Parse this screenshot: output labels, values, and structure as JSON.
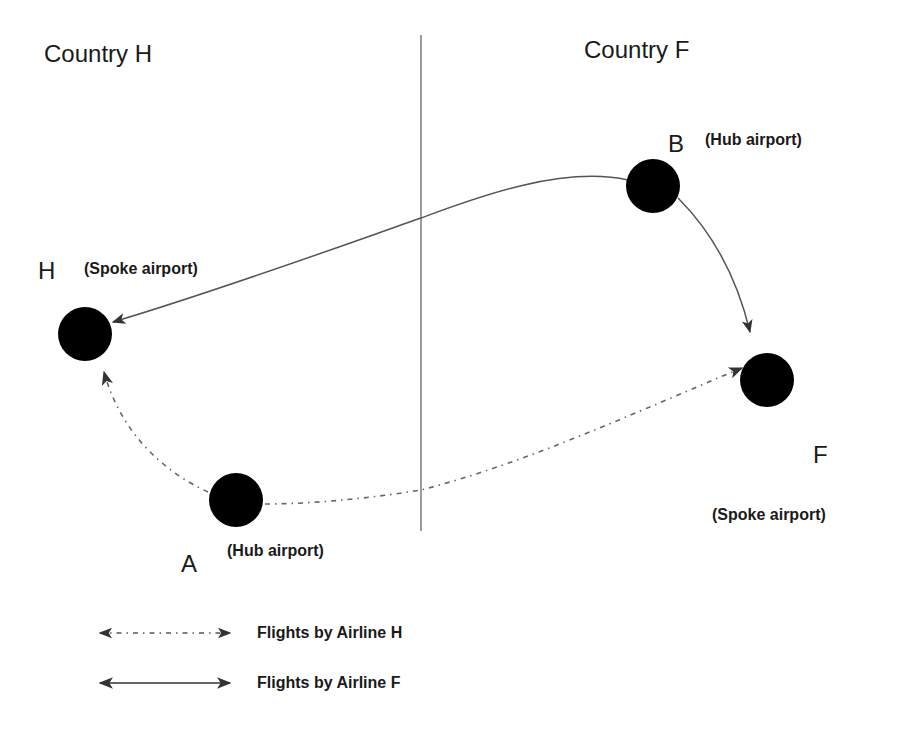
{
  "regions": {
    "left": {
      "label": "Country H"
    },
    "right": {
      "label": "Country F"
    }
  },
  "nodes": {
    "B": {
      "letter": "B",
      "role": "(Hub airport)",
      "country": "F"
    },
    "H": {
      "letter": "H",
      "role": "(Spoke airport)",
      "country": "H"
    },
    "A": {
      "letter": "A",
      "role": "(Hub airport)",
      "country": "H"
    },
    "F": {
      "letter": "F",
      "role": "(Spoke airport)",
      "country": "F"
    }
  },
  "routes": [
    {
      "from": "B",
      "to": "H",
      "airline": "F",
      "style": "solid"
    },
    {
      "from": "B",
      "to": "F",
      "airline": "F",
      "style": "solid"
    },
    {
      "from": "A",
      "to": "H",
      "airline": "H",
      "style": "dash-dot"
    },
    {
      "from": "A",
      "to": "F",
      "airline": "H",
      "style": "dash-dot"
    }
  ],
  "legend": {
    "items": [
      {
        "style": "dash-dot",
        "label": "Flights by Airline H"
      },
      {
        "style": "solid",
        "label": "Flights by Airline F"
      }
    ]
  },
  "colors": {
    "node_fill": "#000000",
    "line": "#555555",
    "divider": "#666666",
    "text": "#1a1a1a",
    "background": "#ffffff"
  }
}
